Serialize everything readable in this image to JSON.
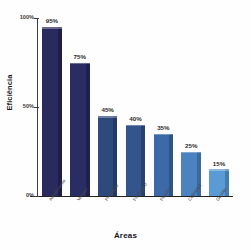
{
  "chart_data": {
    "type": "bar",
    "title": "",
    "xlabel": "Áreas",
    "ylabel": "Eficiência",
    "categories": [
      "Atendimento",
      "Vendas",
      "Produção",
      "Financeiro",
      "Pessoas",
      "Cobrança",
      "Gestão"
    ],
    "values": [
      95,
      75,
      45,
      40,
      35,
      25,
      15
    ],
    "data_labels": [
      "95%",
      "75%",
      "45%",
      "40%",
      "35%",
      "25%",
      "15%"
    ],
    "ylim": [
      0,
      100
    ],
    "ytick_labels": [
      "0%",
      "50%",
      "100%"
    ],
    "ytick_values": [
      0,
      50,
      100
    ],
    "grid": false,
    "legend": false,
    "bar_colors": [
      "#2a2a5e",
      "#2a2d63",
      "#2e4a7d",
      "#33558c",
      "#3c6aa8",
      "#4b83c0",
      "#5b9bd5"
    ],
    "bar_side_colors": [
      "#1b1b42",
      "#1c1f47",
      "#203458",
      "#243c64",
      "#2a4c78",
      "#365f8c",
      "#3f6fa0"
    ]
  }
}
